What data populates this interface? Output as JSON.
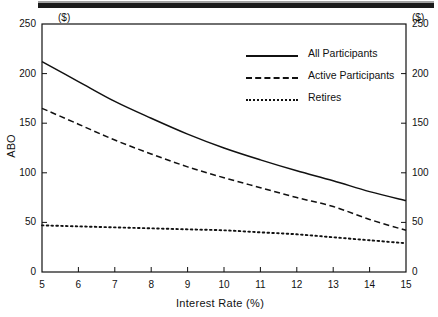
{
  "figure": {
    "top_bar_artifact": true,
    "unit_left": "($)",
    "unit_right": "($)",
    "background": "#ffffff",
    "ink": "#111111"
  },
  "chart_data": {
    "type": "line",
    "title": "",
    "xlabel": "Interest Rate (%)",
    "ylabel": "ABO",
    "unit_label": "($)",
    "xlim": [
      5,
      15
    ],
    "ylim": [
      0,
      250
    ],
    "xticks": [
      5,
      6,
      7,
      8,
      9,
      10,
      11,
      12,
      13,
      14,
      15
    ],
    "xtick_labels": [
      "5",
      "6",
      "7",
      "8",
      "9",
      "10",
      "11",
      "12",
      "13",
      "14",
      "15"
    ],
    "yticks": [
      0,
      50,
      100,
      150,
      200,
      250
    ],
    "ytick_labels": [
      "0",
      "50",
      "100",
      "150",
      "200",
      "250"
    ],
    "ytick_labels_right": [
      "0",
      "50",
      "100",
      "150",
      "200",
      "250"
    ],
    "grid": false,
    "legend_position": "upper right inside",
    "tick_direction": "in",
    "x": [
      5,
      6,
      7,
      8,
      9,
      10,
      11,
      12,
      13,
      14,
      15
    ],
    "series": [
      {
        "name": "All Participants",
        "style": "solid",
        "color": "#111111",
        "values": [
          212,
          192,
          172,
          155,
          139,
          125,
          113,
          102,
          92,
          81,
          72
        ]
      },
      {
        "name": "Active Participants",
        "style": "dashed",
        "color": "#111111",
        "values": [
          165,
          149,
          133,
          119,
          106,
          95,
          85,
          75,
          66,
          53,
          42
        ]
      },
      {
        "name": "Retires",
        "style": "dotted",
        "color": "#111111",
        "values": [
          47,
          46,
          45,
          44,
          43,
          42,
          40,
          38,
          35,
          32,
          29
        ]
      }
    ]
  },
  "legend": {
    "items": [
      {
        "label": "All Participants",
        "style": "solid"
      },
      {
        "label": "Active Participants",
        "style": "dashed"
      },
      {
        "label": "Retires",
        "style": "dotted"
      }
    ]
  }
}
